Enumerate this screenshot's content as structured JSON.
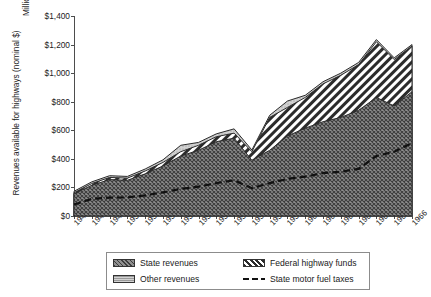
{
  "chart_data": {
    "type": "area",
    "title": "",
    "subtitle": "",
    "xlabel": "",
    "ylabel": "Revenues available for highways (nominal $)",
    "units_label": "Millions",
    "ylim": [
      0,
      1400
    ],
    "ytick_values": [
      0,
      200,
      400,
      600,
      800,
      1000,
      1200,
      1400
    ],
    "ytick_labels": [
      "$0",
      "$200",
      "$400",
      "$600",
      "$800",
      "$1,000",
      "$1,200",
      "$1,400"
    ],
    "grid": false,
    "legend_position": "bottom",
    "stacked": true,
    "categories": [
      "1947",
      "1948",
      "1949",
      "1950",
      "1951",
      "1952",
      "1953",
      "1954",
      "1955",
      "1956",
      "1957",
      "1958",
      "1959",
      "1960",
      "1961",
      "1962",
      "1963",
      "1964",
      "1965",
      "1966"
    ],
    "series": [
      {
        "name": "State revenues",
        "pattern": "dark-crosshatch",
        "color": "#6b6b6b",
        "values": [
          155,
          215,
          255,
          250,
          295,
          350,
          420,
          460,
          520,
          545,
          390,
          460,
          560,
          615,
          660,
          690,
          740,
          830,
          770,
          870
        ]
      },
      {
        "name": "Federal highway funds",
        "pattern": "diagonal-stripes",
        "color": "#ffffff",
        "values": [
          8,
          12,
          15,
          15,
          20,
          25,
          30,
          35,
          35,
          35,
          60,
          230,
          200,
          215,
          265,
          295,
          320,
          390,
          325,
          320
        ]
      },
      {
        "name": "Other revenues",
        "pattern": "light-solid",
        "color": "#c9c9c9",
        "values": [
          10,
          12,
          12,
          12,
          14,
          18,
          45,
          20,
          20,
          30,
          12,
          15,
          45,
          15,
          15,
          15,
          15,
          15,
          12,
          10
        ]
      }
    ],
    "overlay_series": [
      {
        "name": "State motor fuel taxes",
        "style": "dashed-line",
        "color": "#111111",
        "values": [
          80,
          120,
          128,
          130,
          145,
          165,
          190,
          205,
          230,
          250,
          195,
          230,
          260,
          275,
          300,
          310,
          330,
          420,
          450,
          510
        ]
      }
    ],
    "legend_entries": [
      {
        "label": "State revenues",
        "swatch": "sw-state"
      },
      {
        "label": "Federal highway funds",
        "swatch": "sw-federal"
      },
      {
        "label": "Other revenues",
        "swatch": "sw-other"
      },
      {
        "label": "State motor fuel taxes",
        "swatch": "sw-line"
      }
    ]
  }
}
